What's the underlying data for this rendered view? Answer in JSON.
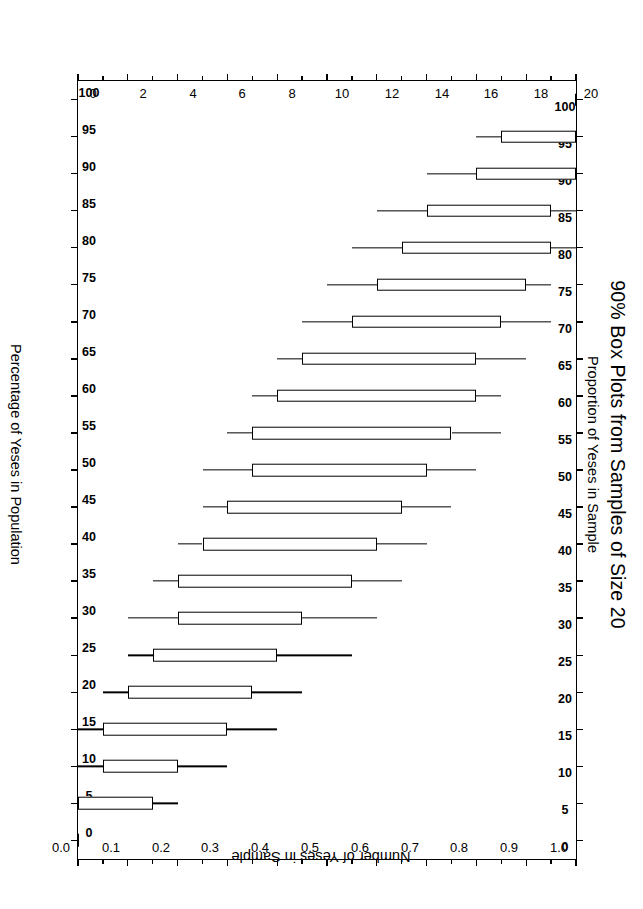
{
  "titles": {
    "main": "90% Box Plots from Samples of Size 20",
    "sub": "Proportion of Yeses in Sample"
  },
  "axes": {
    "bottom_title": "Percentage of Yeses in Population",
    "right_title": "Number of Yeses in Sample",
    "left_title": "Proportion of Yeses in Sample",
    "left_ticks": [
      "0.0",
      "0.1",
      "0.2",
      "0.3",
      "0.4",
      "0.5",
      "0.6",
      "0.7",
      "0.8",
      "0.9",
      "1.0"
    ],
    "right_ticks": [
      "0",
      "2",
      "4",
      "6",
      "8",
      "10",
      "12",
      "14",
      "16",
      "18",
      "20"
    ],
    "top_ticks": [
      "100",
      "95",
      "90",
      "85",
      "80",
      "75",
      "70",
      "65",
      "60",
      "55",
      "50",
      "45",
      "40",
      "35",
      "30",
      "25",
      "20",
      "15",
      "10",
      "5",
      "0"
    ],
    "bottom_ticks": [
      "100",
      "95",
      "90",
      "85",
      "80",
      "75",
      "70",
      "65",
      "60",
      "55",
      "50",
      "45",
      "40",
      "35",
      "30",
      "25",
      "20",
      "15",
      "10",
      "5",
      "0"
    ]
  },
  "chart_data": {
    "type": "box",
    "title": "90% Box Plots from Samples of Size 20",
    "subtitle": "Proportion of Yeses in Sample",
    "xlabel": "Percentage of Yeses in Population",
    "ylabel": "Proportion of Yeses in Sample",
    "y2label": "Number of Yeses in Sample",
    "xlim": [
      100,
      0
    ],
    "ylim": [
      0.0,
      1.0
    ],
    "y2lim": [
      0,
      20
    ],
    "grid": false,
    "legend": "none",
    "sample_size": 20,
    "interval_coverage": "90%",
    "categories": [
      100,
      95,
      90,
      85,
      80,
      75,
      70,
      65,
      60,
      55,
      50,
      45,
      40,
      35,
      30,
      25,
      20,
      15,
      10,
      5,
      0
    ],
    "boxes": [
      {
        "p": 100,
        "lower_whisker": 1.0,
        "q1": 1.0,
        "q3": 1.0,
        "upper_whisker": 1.0
      },
      {
        "p": 95,
        "lower_whisker": 0.8,
        "q1": 0.85,
        "q3": 1.0,
        "upper_whisker": 1.0
      },
      {
        "p": 90,
        "lower_whisker": 0.7,
        "q1": 0.8,
        "q3": 1.0,
        "upper_whisker": 1.0
      },
      {
        "p": 85,
        "lower_whisker": 0.6,
        "q1": 0.7,
        "q3": 0.95,
        "upper_whisker": 1.0
      },
      {
        "p": 80,
        "lower_whisker": 0.55,
        "q1": 0.65,
        "q3": 0.95,
        "upper_whisker": 1.0
      },
      {
        "p": 75,
        "lower_whisker": 0.5,
        "q1": 0.6,
        "q3": 0.9,
        "upper_whisker": 0.95
      },
      {
        "p": 70,
        "lower_whisker": 0.45,
        "q1": 0.55,
        "q3": 0.85,
        "upper_whisker": 0.95
      },
      {
        "p": 65,
        "lower_whisker": 0.4,
        "q1": 0.45,
        "q3": 0.8,
        "upper_whisker": 0.9
      },
      {
        "p": 60,
        "lower_whisker": 0.35,
        "q1": 0.4,
        "q3": 0.8,
        "upper_whisker": 0.85
      },
      {
        "p": 55,
        "lower_whisker": 0.3,
        "q1": 0.35,
        "q3": 0.75,
        "upper_whisker": 0.85
      },
      {
        "p": 50,
        "lower_whisker": 0.25,
        "q1": 0.35,
        "q3": 0.7,
        "upper_whisker": 0.8
      },
      {
        "p": 45,
        "lower_whisker": 0.25,
        "q1": 0.3,
        "q3": 0.65,
        "upper_whisker": 0.75
      },
      {
        "p": 40,
        "lower_whisker": 0.2,
        "q1": 0.25,
        "q3": 0.6,
        "upper_whisker": 0.7
      },
      {
        "p": 35,
        "lower_whisker": 0.15,
        "q1": 0.2,
        "q3": 0.55,
        "upper_whisker": 0.65
      },
      {
        "p": 30,
        "lower_whisker": 0.1,
        "q1": 0.2,
        "q3": 0.45,
        "upper_whisker": 0.6
      },
      {
        "p": 25,
        "lower_whisker": 0.1,
        "q1": 0.15,
        "q3": 0.4,
        "upper_whisker": 0.55
      },
      {
        "p": 20,
        "lower_whisker": 0.05,
        "q1": 0.1,
        "q3": 0.35,
        "upper_whisker": 0.45
      },
      {
        "p": 15,
        "lower_whisker": 0.0,
        "q1": 0.05,
        "q3": 0.3,
        "upper_whisker": 0.4
      },
      {
        "p": 10,
        "lower_whisker": 0.0,
        "q1": 0.05,
        "q3": 0.2,
        "upper_whisker": 0.3
      },
      {
        "p": 5,
        "lower_whisker": 0.0,
        "q1": 0.0,
        "q3": 0.15,
        "upper_whisker": 0.2
      },
      {
        "p": 0,
        "lower_whisker": 0.0,
        "q1": 0.0,
        "q3": 0.0,
        "upper_whisker": 0.0
      }
    ]
  }
}
